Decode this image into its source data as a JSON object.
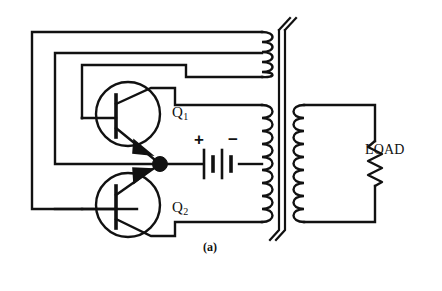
{
  "figure": {
    "caption": "(a)",
    "background_color": "#ffffff",
    "line_color": "#111111",
    "type": "schematic-circuit-diagram"
  },
  "labels": {
    "q1": "Q",
    "q1_sub": "1",
    "q2": "Q",
    "q2_sub": "2",
    "load": "LOAD",
    "battery_positive": "+",
    "battery_negative": "−"
  },
  "components": {
    "transistor_q1": {
      "name": "Q1",
      "type": "NPN bipolar junction transistor",
      "symbol": "circle-with-base-bar-and-emitter-arrow"
    },
    "transistor_q2": {
      "name": "Q2",
      "type": "NPN bipolar junction transistor",
      "symbol": "circle-with-base-bar-and-emitter-arrow"
    },
    "battery": {
      "name": "DC supply battery",
      "cells": 2,
      "plates": 4,
      "polarity_left": "+",
      "polarity_right": "−"
    },
    "transformer": {
      "name": "Center-tapped output transformer",
      "core_style": "double-vertical-line-laminated-core",
      "primary_upper_turns": 4,
      "primary_lower_turns": 9,
      "secondary_turns": 9,
      "center_tapped": true
    },
    "load_resistor": {
      "name": "LOAD",
      "symbol": "zigzag-resistor",
      "zigzag_peaks": 6
    },
    "junction_node": {
      "name": "emitter-common-node",
      "symbol": "filled-dot"
    }
  }
}
